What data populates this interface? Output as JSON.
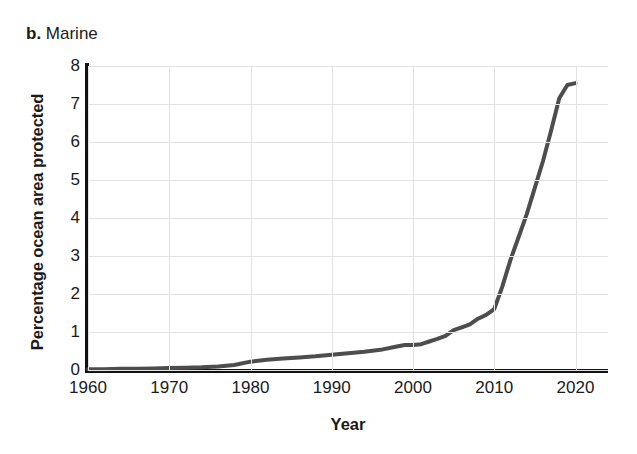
{
  "panel": {
    "tag": "b.",
    "name": "Marine"
  },
  "chart_data": {
    "type": "line",
    "title": "b. Marine",
    "xlabel": "Year",
    "ylabel": "Percentage ocean area protected",
    "xlim": [
      1960,
      2024
    ],
    "ylim": [
      0,
      8
    ],
    "xticks": [
      1960,
      1970,
      1980,
      1990,
      2000,
      2010,
      2020
    ],
    "yticks": [
      0,
      1,
      2,
      3,
      4,
      5,
      6,
      7,
      8
    ],
    "grid": true,
    "legend": "none",
    "line_color": "#4d4d4d",
    "line_width": 4,
    "series": [
      {
        "name": "Percentage ocean area protected",
        "x": [
          1960,
          1962,
          1964,
          1966,
          1968,
          1970,
          1972,
          1974,
          1976,
          1978,
          1980,
          1982,
          1984,
          1986,
          1988,
          1990,
          1992,
          1994,
          1996,
          1998,
          1999,
          2000,
          2001,
          2002,
          2003,
          2004,
          2005,
          2006,
          2007,
          2008,
          2009,
          2010,
          2011,
          2012,
          2013,
          2014,
          2015,
          2016,
          2017,
          2018,
          2019,
          2020
        ],
        "values": [
          0.02,
          0.02,
          0.03,
          0.03,
          0.04,
          0.05,
          0.06,
          0.07,
          0.09,
          0.13,
          0.22,
          0.27,
          0.3,
          0.33,
          0.36,
          0.4,
          0.44,
          0.48,
          0.53,
          0.62,
          0.66,
          0.66,
          0.68,
          0.75,
          0.82,
          0.9,
          1.05,
          1.12,
          1.2,
          1.35,
          1.45,
          1.6,
          2.2,
          2.9,
          3.5,
          4.1,
          4.8,
          5.5,
          6.3,
          7.15,
          7.5,
          7.55
        ]
      }
    ]
  }
}
